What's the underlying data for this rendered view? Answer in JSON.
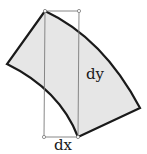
{
  "diagram": {
    "labels": {
      "dy": "dy",
      "dx": "dx"
    },
    "colors": {
      "fill": "#e6e6e6",
      "outline": "#1a1a1a",
      "guide": "#7a7a7a",
      "background": "#ffffff"
    },
    "shape": "curved quadrilateral element (annular sector) with bounding rectangle showing dx and dy"
  }
}
